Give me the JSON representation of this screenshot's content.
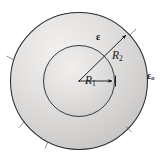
{
  "figure": {
    "kind": "concentric-circles-cross-section",
    "width": 168,
    "height": 159,
    "background_color": "#ffffff"
  },
  "geometry": {
    "center_x": 79,
    "center_y": 81,
    "inner_radius": 36,
    "outer_radius": 69,
    "inner_circle_stroke": "#3a3a3a",
    "outer_circle_stroke": "#2e2e2e",
    "shell_fill_light": "#eceaea",
    "shell_fill_mid": "#d9d7d6",
    "shell_fill_dark": "#c2c0bf",
    "core_fill_light": "#ecebeb",
    "core_fill_dark": "#cfcecd",
    "leader_line_color": "#1b1b1b"
  },
  "labels": {
    "epsilon": "ε",
    "epsilon_zero_symbol": "ε",
    "epsilon_zero_subscript": "o",
    "radius_inner_symbol": "R",
    "radius_inner_subscript": "1",
    "radius_outer_symbol": "R",
    "radius_outer_subscript": "2"
  },
  "leaders": {
    "r1_arrow": {
      "from_x": 79,
      "from_y": 81,
      "to_x": 115,
      "to_y": 81,
      "direction": "right-horizontal",
      "target": "inner-circle-boundary"
    },
    "r2_arrow": {
      "from_x": 79,
      "from_y": 81,
      "to_x": 128,
      "to_y": 33,
      "direction": "up-right-diagonal",
      "target": "outer-circle-boundary"
    }
  },
  "tick_marks": [
    {
      "angle_deg": 318,
      "name": "tick-upper-right"
    },
    {
      "angle_deg": 210,
      "name": "tick-lower-left"
    },
    {
      "angle_deg": 160,
      "name": "tick-left"
    },
    {
      "angle_deg": 48,
      "name": "tick-lower-right"
    }
  ]
}
